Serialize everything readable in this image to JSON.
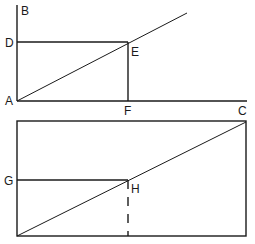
{
  "figure_top": {
    "labels": {
      "A": "A",
      "B": "B",
      "C": "C",
      "D": "D",
      "E": "E",
      "F": "F"
    },
    "description": "Right angle BAC with line from A through E; rectangle ADEF inscribed with E on the diagonal"
  },
  "figure_bottom": {
    "labels": {
      "G": "G",
      "H": "H"
    },
    "description": "Rectangle with diagonal from bottom-left to top-right; horizontal segment from G to H on diagonal; dashed vertical line from H to base"
  },
  "colors": {
    "stroke": "#1a1a1a",
    "background": "#ffffff"
  }
}
